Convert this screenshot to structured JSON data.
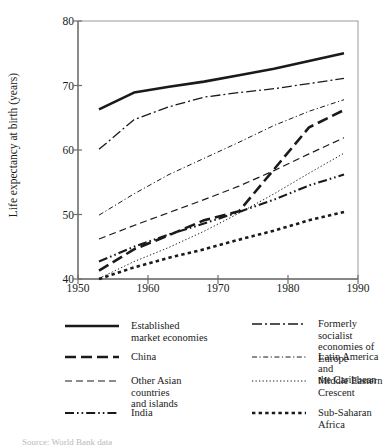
{
  "chart_data": {
    "type": "line",
    "title": "",
    "xlabel": "",
    "ylabel": "Life expectancy at birth (years)",
    "xlim": [
      1950,
      1990
    ],
    "ylim": [
      40,
      80
    ],
    "xticks": [
      1950,
      1960,
      1970,
      1980,
      1990
    ],
    "yticks": [
      40,
      50,
      60,
      70,
      80
    ],
    "grid": false,
    "legend_position": "below",
    "x": [
      1953,
      1958,
      1963,
      1968,
      1973,
      1978,
      1983,
      1988
    ],
    "series": [
      {
        "name": "Established market economies",
        "style": "solid-bold",
        "values": [
          66.3,
          68.9,
          69.8,
          70.6,
          71.6,
          72.6,
          73.8,
          75.0
        ]
      },
      {
        "name": "Formerly socialist economies of Europe",
        "style": "dash-dot",
        "values": [
          60.1,
          64.7,
          66.7,
          68.2,
          68.9,
          69.5,
          70.3,
          71.1
        ]
      },
      {
        "name": "Latin America and the Caribbean",
        "style": "fine-dash-dot",
        "values": [
          49.9,
          53.2,
          56.2,
          58.7,
          61.2,
          63.8,
          66.0,
          67.8
        ]
      },
      {
        "name": "China",
        "style": "bold-dash",
        "values": [
          41.3,
          44.6,
          46.8,
          49.1,
          50.5,
          57.0,
          63.5,
          66.2
        ]
      },
      {
        "name": "Other Asian countries and islands",
        "style": "dash",
        "values": [
          46.2,
          48.3,
          50.3,
          52.3,
          54.4,
          56.8,
          59.4,
          61.9
        ]
      },
      {
        "name": "Middle Eastern Crescent",
        "style": "dotted",
        "values": [
          40.1,
          42.7,
          44.9,
          47.4,
          50.2,
          53.2,
          56.4,
          59.5
        ]
      },
      {
        "name": "India",
        "style": "dash-dot-dot",
        "values": [
          42.7,
          45.0,
          46.9,
          48.6,
          50.4,
          52.3,
          54.5,
          56.2
        ]
      },
      {
        "name": "Sub-Saharan Africa",
        "style": "bold-dotted",
        "values": [
          40.0,
          41.8,
          43.3,
          44.6,
          46.1,
          47.5,
          49.1,
          50.4
        ]
      }
    ]
  },
  "axis": {
    "y_label": "Life expectancy at birth (years)",
    "y_tick_labels": [
      "40",
      "50",
      "60",
      "70",
      "80"
    ],
    "x_tick_labels": [
      "1950",
      "1960",
      "1970",
      "1980",
      "1990"
    ]
  },
  "legend": {
    "left_column": [
      {
        "label_line1": "Established",
        "label_line2": "market economies",
        "style": "solid-bold"
      },
      {
        "label_line1": "China",
        "label_line2": "",
        "style": "bold-dash"
      },
      {
        "label_line1": "Other Asian countries",
        "label_line2": "and islands",
        "style": "dash"
      },
      {
        "label_line1": "India",
        "label_line2": "",
        "style": "dash-dot-dot"
      }
    ],
    "right_column": [
      {
        "label_line1": "Formerly socialist",
        "label_line2": "economies of",
        "label_line3": "Europe",
        "style": "dash-dot"
      },
      {
        "label_line1": "Latin America and",
        "label_line2": "the Caribbean",
        "label_line3": "",
        "style": "fine-dash-dot"
      },
      {
        "label_line1": "Middle Eastern",
        "label_line2": "Crescent",
        "label_line3": "",
        "style": "dotted"
      },
      {
        "label_line1": "Sub-Saharan Africa",
        "label_line2": "",
        "label_line3": "",
        "style": "bold-dotted"
      }
    ]
  },
  "source": {
    "text": "Source: World Bank data"
  },
  "colors": {
    "ink": "#1a1a1a",
    "axis": "#7a7a7a",
    "paper": "#ffffff"
  }
}
